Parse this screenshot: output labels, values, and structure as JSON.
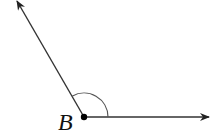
{
  "diagram": {
    "type": "angle",
    "vertex": {
      "label": "B",
      "x": 84,
      "y": 117
    },
    "rays": [
      {
        "name": "upper-left-ray",
        "from": [
          84,
          117
        ],
        "to": [
          17,
          1
        ]
      },
      {
        "name": "right-ray",
        "from": [
          84,
          117
        ],
        "to": [
          209,
          117
        ]
      }
    ],
    "arc": {
      "radius": 24,
      "marks": "obtuse angle"
    },
    "colors": {
      "line": "#333333",
      "arc": "#555555",
      "point": "#000000"
    }
  }
}
